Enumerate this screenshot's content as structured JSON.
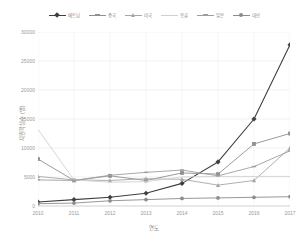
{
  "chart_data": {
    "type": "line",
    "title": "",
    "xlabel": "연도",
    "ylabel": "지원학생수 (명)",
    "categories": [
      "2010",
      "2011",
      "2012",
      "2013",
      "2014",
      "2015",
      "2016",
      "2017"
    ],
    "ylim": [
      0,
      30000
    ],
    "yticks": [
      0,
      5000,
      10000,
      15000,
      20000,
      25000,
      30000
    ],
    "ytick_labels": [
      "0",
      "5000",
      "10000",
      "15000",
      "20000",
      "25000",
      "30000"
    ],
    "grid": true,
    "legend_position": "top",
    "series": [
      {
        "name": "베트남",
        "color": "#3f3f3f",
        "marker": "diamond",
        "values": [
          700,
          1100,
          1500,
          2200,
          3900,
          7600,
          15000,
          27800
        ]
      },
      {
        "name": "중국",
        "color": "#8f8f8f",
        "marker": "square",
        "values": [
          8100,
          4400,
          5200,
          4400,
          5700,
          5500,
          10700,
          12500
        ]
      },
      {
        "name": "미국",
        "color": "#a6a6a6",
        "marker": "triangle",
        "values": [
          5100,
          4500,
          4400,
          4700,
          4600,
          3600,
          4400,
          10000
        ]
      },
      {
        "name": "몽골",
        "color": "#d0d0d0",
        "marker": "none",
        "values": [
          13200,
          4500,
          4100,
          4200,
          5000,
          5100,
          5100,
          5100
        ]
      },
      {
        "name": "일본",
        "color": "#9e9e9e",
        "marker": "dash",
        "values": [
          4500,
          4400,
          5300,
          5800,
          6200,
          5200,
          6800,
          9500
        ]
      },
      {
        "name": "대만",
        "color": "#8c8c8c",
        "marker": "circle",
        "values": [
          400,
          500,
          900,
          1100,
          1300,
          1400,
          1500,
          1600
        ]
      }
    ]
  }
}
